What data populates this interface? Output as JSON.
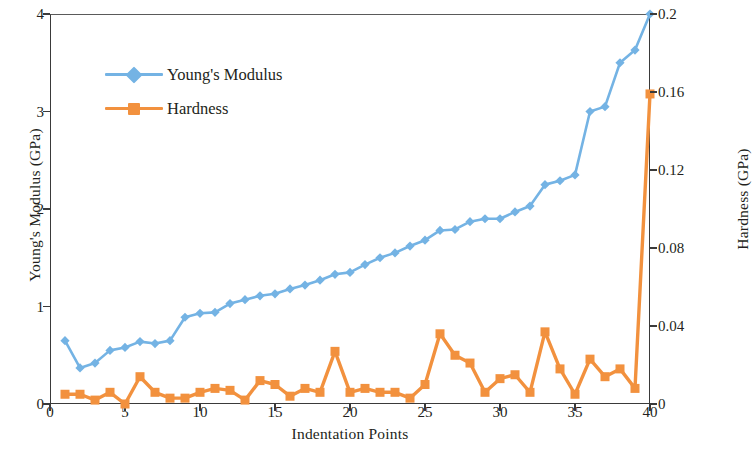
{
  "chart_data": {
    "type": "line",
    "title": "",
    "xlabel": "Indentation Points",
    "ylabel": "Young's Modulus (GPa)",
    "y2label": "Hardness (GPa)",
    "xlim": [
      0,
      40
    ],
    "ylim": [
      0,
      4
    ],
    "y2lim": [
      0,
      0.2
    ],
    "xticks": [
      0,
      5,
      10,
      15,
      20,
      25,
      30,
      35,
      40
    ],
    "xticklabels": [
      "0",
      "5",
      "10",
      "15",
      "20",
      "25",
      "30",
      "35",
      "40"
    ],
    "yticks": [
      0,
      1,
      2,
      3,
      4
    ],
    "yticklabels": [
      "0",
      "1",
      "2",
      "3",
      "4"
    ],
    "y2ticks": [
      0,
      0.04,
      0.08,
      0.12,
      0.16,
      0.2
    ],
    "y2ticklabels": [
      "0",
      "0.04",
      "0.08",
      "0.12",
      "0.16",
      "0.2"
    ],
    "grid": false,
    "legend_position": "upper left",
    "x": [
      1,
      2,
      3,
      4,
      5,
      6,
      7,
      8,
      9,
      10,
      11,
      12,
      13,
      14,
      15,
      16,
      17,
      18,
      19,
      20,
      21,
      22,
      23,
      24,
      25,
      26,
      27,
      28,
      29,
      30,
      31,
      32,
      33,
      34,
      35,
      36,
      37,
      38,
      39,
      40
    ],
    "series": [
      {
        "name": "Young's Modulus",
        "axis": "left",
        "color": "#74B3E4",
        "marker": "diamond",
        "values": [
          0.65,
          0.37,
          0.42,
          0.55,
          0.58,
          0.64,
          0.62,
          0.65,
          0.89,
          0.93,
          0.94,
          1.03,
          1.07,
          1.11,
          1.13,
          1.18,
          1.22,
          1.27,
          1.33,
          1.35,
          1.43,
          1.5,
          1.55,
          1.62,
          1.68,
          1.78,
          1.79,
          1.87,
          1.9,
          1.9,
          1.97,
          2.03,
          2.25,
          2.29,
          2.35,
          3.0,
          3.05,
          3.5,
          3.63,
          4.0
        ]
      },
      {
        "name": "Hardness",
        "axis": "right",
        "color": "#F2913E",
        "marker": "square",
        "values": [
          0.005,
          0.005,
          0.002,
          0.006,
          0.0,
          0.014,
          0.006,
          0.003,
          0.003,
          0.006,
          0.008,
          0.007,
          0.002,
          0.012,
          0.01,
          0.004,
          0.008,
          0.006,
          0.027,
          0.006,
          0.008,
          0.006,
          0.006,
          0.003,
          0.01,
          0.036,
          0.025,
          0.021,
          0.006,
          0.013,
          0.015,
          0.006,
          0.037,
          0.018,
          0.005,
          0.023,
          0.014,
          0.018,
          0.008,
          0.159
        ]
      }
    ]
  },
  "legend": {
    "items": [
      {
        "label": "Young's Modulus",
        "color": "#74B3E4",
        "marker": "diamond"
      },
      {
        "label": "Hardness",
        "color": "#F2913E",
        "marker": "square"
      }
    ]
  },
  "axes": {
    "y_left_title": "Young's Modulus (GPa)",
    "y_right_title": "Hardness (GPa)",
    "x_title": "Indentation Points"
  }
}
